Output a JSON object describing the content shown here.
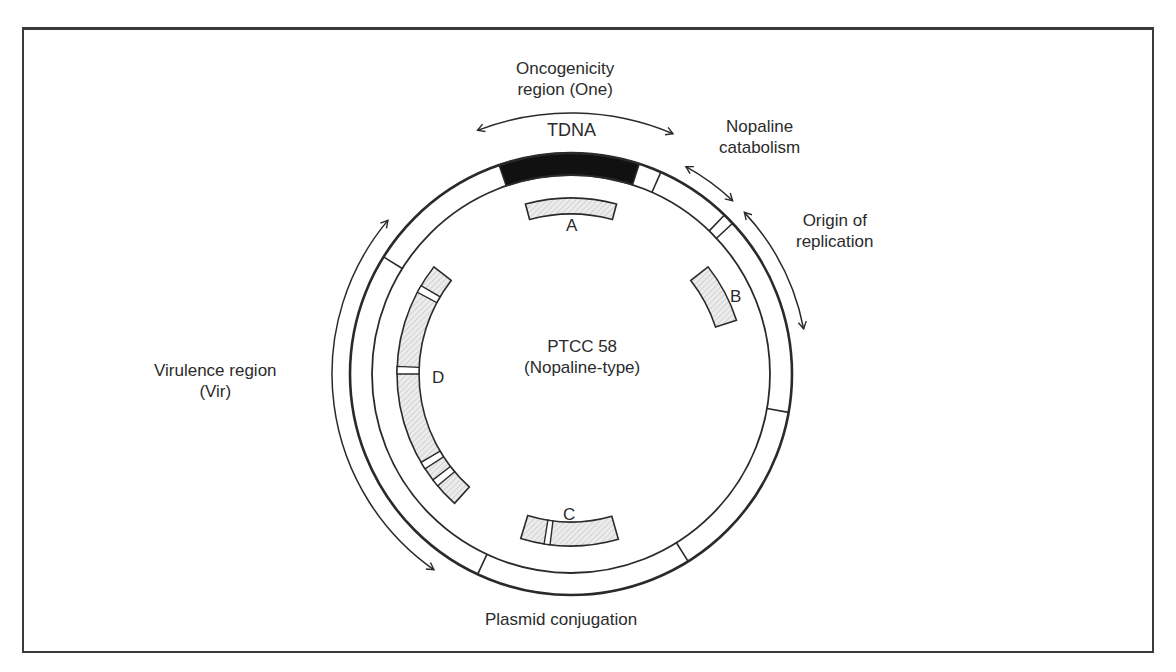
{
  "figure": {
    "title": "PTCC 58",
    "subtitle": "(Nopaline-type)",
    "regions": [
      {
        "id": "oncogenicity",
        "line1": "Oncogenicity",
        "line2": "region (One)"
      },
      {
        "id": "tdna",
        "line1": "TDNA"
      },
      {
        "id": "nopaline-catabolism",
        "line1": "Nopaline",
        "line2": "catabolism"
      },
      {
        "id": "origin-of-replication",
        "line1": "Origin of",
        "line2": "replication"
      },
      {
        "id": "virulence",
        "line1": "Virulence region",
        "line2": "(Vir)"
      },
      {
        "id": "plasmid-conjugation",
        "line1": "Plasmid conjugation"
      }
    ],
    "fragments": [
      "A",
      "B",
      "C",
      "D"
    ],
    "colors": {
      "line": "#2a2a2a",
      "tdna_fill": "#111111",
      "hatch_fill": "#e6e6e6",
      "background": "#ffffff"
    }
  }
}
